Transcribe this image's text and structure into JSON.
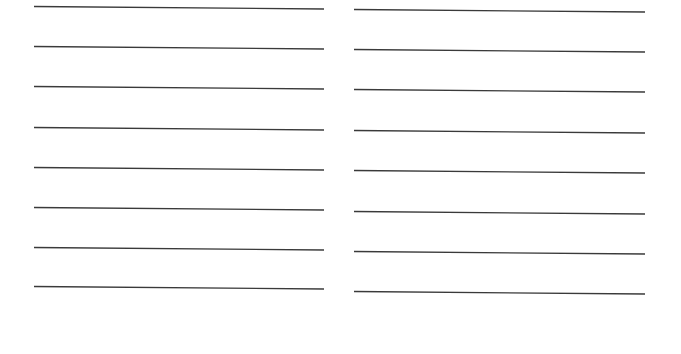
{
  "page": {
    "background": "#ffffff",
    "line_color": "#3a3a3a",
    "columns": [
      {
        "name": "left",
        "x1": 34,
        "x2": 324,
        "lines_y_start": [
          6,
          46,
          86,
          127,
          167,
          207,
          247,
          286
        ],
        "tilt": 2.5
      },
      {
        "name": "right",
        "x1": 354,
        "x2": 645,
        "lines_y_start": [
          9,
          49,
          89,
          130,
          170,
          211,
          251,
          291
        ],
        "tilt": 2.5
      }
    ]
  }
}
